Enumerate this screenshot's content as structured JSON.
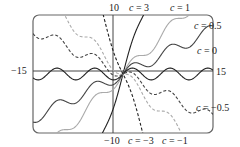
{
  "chart_data": {
    "type": "line",
    "title": "",
    "function": "y = c*x + sin(x)",
    "xlabel": "",
    "ylabel": "",
    "xlim": [
      -15,
      15
    ],
    "ylim": [
      -10,
      10
    ],
    "grid": false,
    "legend_position": "inline labels at curve ends",
    "axis_labels": {
      "x_min": "−15",
      "x_max": "15",
      "y_max": "10",
      "y_min": "−10"
    },
    "series": [
      {
        "name": "c = 3",
        "c": 3,
        "style": "solid",
        "color": "#222222"
      },
      {
        "name": "c = 1",
        "c": 1,
        "style": "solid",
        "color": "#aaaaaa"
      },
      {
        "name": "c = 0.5",
        "c": 0.5,
        "style": "solid",
        "color": "#444444"
      },
      {
        "name": "c = 0",
        "c": 0,
        "style": "solid",
        "color": "#222222"
      },
      {
        "name": "c = −0.5",
        "c": -0.5,
        "style": "dashed",
        "color": "#444444"
      },
      {
        "name": "c = −1",
        "c": -1,
        "style": "dashed",
        "color": "#aaaaaa"
      },
      {
        "name": "c = −3",
        "c": -3,
        "style": "dashed",
        "color": "#222222"
      }
    ]
  },
  "labels": {
    "y_top": "10",
    "y_bottom": "−10",
    "x_left": "−15",
    "x_right": "15",
    "c3": "c = 3",
    "c1": "c = 1",
    "c05": "c = 0.5",
    "c0": "c = 0",
    "cm05": "c = −0.5",
    "cm1": "c = −1",
    "cm3": "c = −3"
  }
}
